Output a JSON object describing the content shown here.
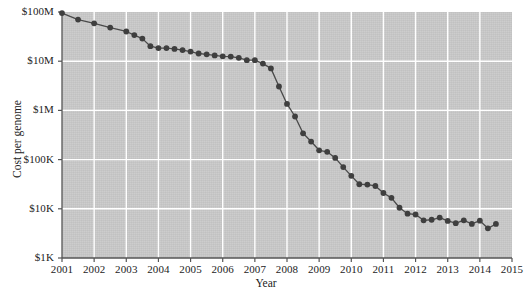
{
  "chart_data": {
    "type": "line",
    "title": "",
    "xlabel": "Year",
    "ylabel": "Cost per genome",
    "yscale": "log",
    "ylim": [
      1000,
      100000000
    ],
    "xlim": [
      2001,
      2015
    ],
    "grid": true,
    "legend": null,
    "ytick_labels": [
      "$100M",
      "$10M",
      "$1M",
      "$100K",
      "$10K",
      "$1K"
    ],
    "ytick_values": [
      100000000,
      10000000,
      1000000,
      100000,
      10000,
      1000
    ],
    "xtick_labels": [
      "2001",
      "2002",
      "2003",
      "2004",
      "2005",
      "2006",
      "2007",
      "2008",
      "2009",
      "2010",
      "2011",
      "2012",
      "2013",
      "2014",
      "2015"
    ],
    "xtick_values": [
      2001,
      2002,
      2003,
      2004,
      2005,
      2006,
      2007,
      2008,
      2009,
      2010,
      2011,
      2012,
      2013,
      2014,
      2015
    ],
    "series": [
      {
        "name": "Cost per genome",
        "color": "#4a4a4a",
        "marker": "circle",
        "x": [
          2001.0,
          2001.5,
          2002.0,
          2002.5,
          2003.0,
          2003.25,
          2003.5,
          2003.75,
          2004.0,
          2004.25,
          2004.5,
          2004.75,
          2005.0,
          2005.25,
          2005.5,
          2005.75,
          2006.0,
          2006.25,
          2006.5,
          2006.75,
          2007.0,
          2007.25,
          2007.5,
          2007.75,
          2008.0,
          2008.25,
          2008.5,
          2008.75,
          2009.0,
          2009.25,
          2009.5,
          2009.75,
          2010.0,
          2010.25,
          2010.5,
          2010.75,
          2011.0,
          2011.25,
          2011.5,
          2011.75,
          2012.0,
          2012.25,
          2012.5,
          2012.75,
          2013.0,
          2013.25,
          2013.5,
          2013.75,
          2014.0,
          2014.25,
          2014.5
        ],
        "y": [
          95263072,
          70175437,
          58987875,
          48158402,
          40157554,
          33911264,
          28780376,
          20181342,
          18519312,
          18519312,
          17735651,
          16798589,
          15709052,
          14326858,
          13801124,
          13125330,
          12586132,
          12413457,
          11732535,
          10474556,
          10497892,
          8927342,
          7147571,
          3063820,
          1352982,
          752080,
          342502,
          232735,
          154714,
          144206,
          108065,
          70333,
          46774,
          31512,
          31125,
          29092,
          20963,
          16712,
          10497,
          7950,
          7666,
          5826,
          5985,
          6618,
          5671,
          5096,
          5826,
          4920,
          5731,
          4008,
          4920
        ],
        "annotation": "Logarithmic vertical axis; cost of sequencing one human-sized genome, 2001-2014"
      }
    ]
  },
  "axes": {
    "y_title": "Cost per genome",
    "x_title": "Year"
  },
  "style": {
    "plot_background": "#c9c9c9",
    "gridline_color": "#ffffff",
    "line_color": "#4a4a4a",
    "marker_color": "#3f3f3f",
    "axis_color": "#555555",
    "text_color": "#1c1c1c",
    "page_background": "#ffffff"
  }
}
